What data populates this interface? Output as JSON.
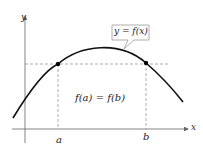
{
  "diagram": {
    "axis_labels": {
      "x": "x",
      "y": "y"
    },
    "curve_label": "y = f(x)",
    "equation": "f(a) = f(b)",
    "ticks": {
      "a": "a",
      "b": "b"
    },
    "colors": {
      "curve": "#111111",
      "axis": "#555555",
      "dash": "#888888"
    }
  }
}
